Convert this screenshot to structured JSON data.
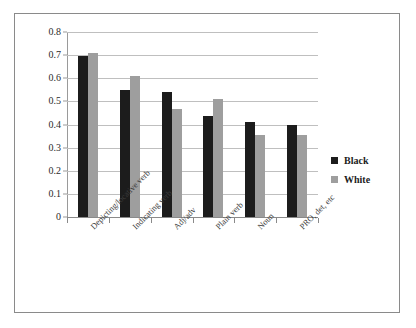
{
  "chart_data": {
    "type": "bar",
    "title": "",
    "xlabel": "",
    "ylabel": "",
    "ylim": [
      0,
      0.8
    ],
    "ytick_labels": [
      "0",
      "0.1",
      "0.2",
      "0.3",
      "0.4",
      "0.5",
      "0.6",
      "0.7",
      "0.8"
    ],
    "ytick_values": [
      0,
      0.1,
      0.2,
      0.3,
      0.4,
      0.5,
      0.6,
      0.7,
      0.8
    ],
    "grid": true,
    "legend_position": "right",
    "categories": [
      "Depicting/locative verb",
      "Indicating verb",
      "Adj/adv",
      "Plain verb",
      "Noun",
      "PRO, det, etc"
    ],
    "series": [
      {
        "name": "Black",
        "color": "#1c1c1c",
        "values": [
          0.695,
          0.55,
          0.54,
          0.435,
          0.412,
          0.4
        ]
      },
      {
        "name": "White",
        "color": "#9e9e9e",
        "values": [
          0.71,
          0.608,
          0.465,
          0.512,
          0.355,
          0.353
        ]
      }
    ]
  },
  "legend": {
    "items": [
      {
        "label": "Black",
        "color": "#1c1c1c"
      },
      {
        "label": "White",
        "color": "#9e9e9e"
      }
    ]
  },
  "figure": {
    "border_color": "#8a8a8a",
    "background": "#ffffff"
  }
}
